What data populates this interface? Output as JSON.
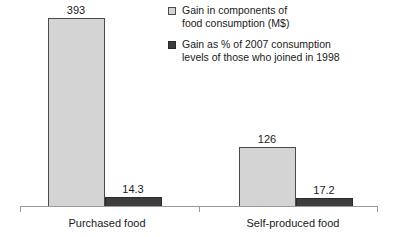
{
  "chart_data": {
    "type": "bar",
    "title": "",
    "subtitle": "",
    "xlabel": "",
    "ylabel": "",
    "grid": false,
    "legend_position": "top-right",
    "categories": [
      "Purchased food",
      "Self-produced food"
    ],
    "series": [
      {
        "name": "Gain in components of food consumption (M$)",
        "legend_line1": "Gain in components of",
        "legend_line2": "food consumption (M$)",
        "marker": "light-square-swatch",
        "color": "#d4d4d4",
        "border_color": "#4a4a4a",
        "values": [
          393,
          126
        ],
        "value_labels": [
          "393",
          "126"
        ]
      },
      {
        "name": "Gain as % of 2007 consumption levels of those who joined in 1998",
        "legend_line1": "Gain as % of 2007 consumption",
        "legend_line2": "levels of those who joined in 1998",
        "marker": "dark-square-swatch",
        "color": "#3d3d3d",
        "border_color": "#2a2a2a",
        "values": [
          14.3,
          17.2
        ],
        "value_labels": [
          "14.3",
          "17.2"
        ]
      }
    ],
    "ylim": [
      0,
      393
    ],
    "axis_color": "#9a9a9a"
  },
  "axis": {
    "tick_left": "",
    "tick_mid": "",
    "tick_right": ""
  }
}
